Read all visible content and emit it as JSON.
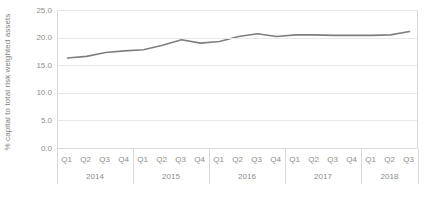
{
  "chart_data": {
    "type": "line",
    "title": "",
    "xlabel": "",
    "ylabel": "% capital to total risk weighted assets",
    "ylim": [
      0.0,
      25.0
    ],
    "yticks": [
      "0.0",
      "5.0",
      "10.0",
      "15.0",
      "20.0",
      "25.0"
    ],
    "ytick_values": [
      0.0,
      5.0,
      10.0,
      15.0,
      20.0,
      25.0
    ],
    "grid": "horizontal",
    "legend": "none",
    "line_color": "#7f7f7f",
    "categories": [
      "Q1 2014",
      "Q2 2014",
      "Q3 2014",
      "Q4 2014",
      "Q1 2015",
      "Q2 2015",
      "Q3 2015",
      "Q4 2015",
      "Q1 2016",
      "Q2 2016",
      "Q3 2016",
      "Q4 2016",
      "Q1 2017",
      "Q2 2017",
      "Q3 2017",
      "Q4 2017",
      "Q1 2018",
      "Q2 2018",
      "Q3 2018"
    ],
    "quarter_labels": [
      "Q1",
      "Q2",
      "Q3",
      "Q4",
      "Q1",
      "Q2",
      "Q3",
      "Q4",
      "Q1",
      "Q2",
      "Q3",
      "Q4",
      "Q1",
      "Q2",
      "Q3",
      "Q4",
      "Q1",
      "Q2",
      "Q3"
    ],
    "year_groups": [
      {
        "label": "2014",
        "count": 4
      },
      {
        "label": "2015",
        "count": 4
      },
      {
        "label": "2016",
        "count": 4
      },
      {
        "label": "2017",
        "count": 4
      },
      {
        "label": "2018",
        "count": 3
      }
    ],
    "values": [
      16.3,
      16.6,
      17.3,
      17.6,
      17.8,
      18.6,
      19.6,
      19.0,
      19.3,
      20.2,
      20.7,
      20.2,
      20.5,
      20.5,
      20.4,
      20.4,
      20.4,
      20.5,
      21.1
    ],
    "series": [
      {
        "name": "% capital to total risk weighted assets",
        "color": "#7f7f7f",
        "values": [
          16.3,
          16.6,
          17.3,
          17.6,
          17.8,
          18.6,
          19.6,
          19.0,
          19.3,
          20.2,
          20.7,
          20.2,
          20.5,
          20.5,
          20.4,
          20.4,
          20.4,
          20.5,
          21.1
        ]
      }
    ]
  }
}
